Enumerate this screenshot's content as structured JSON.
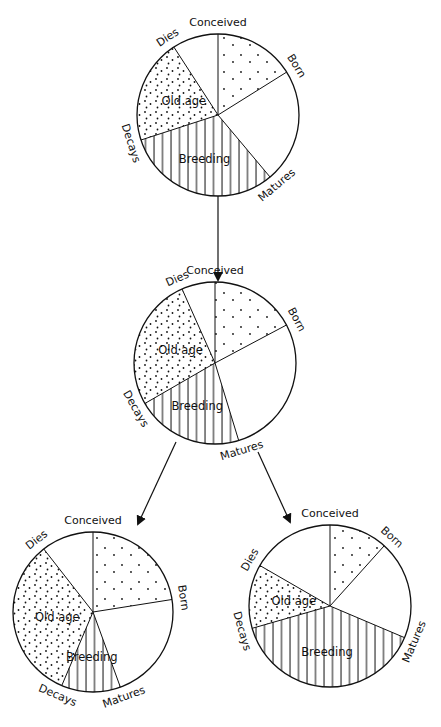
{
  "diagram": {
    "title": "",
    "stage_labels": {
      "conceived": "Conceived",
      "born": "Born",
      "matures": "Matures",
      "decays": "Decays",
      "dies": "Dies"
    },
    "phase_labels": {
      "old_age": "Old age",
      "breeding": "Breeding"
    },
    "patterns": {
      "juvenile": "dotted-sparse",
      "old_age": "dotted-dense",
      "breeding": "vertical-hatch",
      "maturation": "blank",
      "post_death": "blank"
    },
    "colors": {
      "ink": "#111111",
      "background": "#ffffff"
    },
    "pies": [
      {
        "id": "top",
        "cx": 218,
        "cy": 115,
        "r": 81,
        "angles": {
          "conceived": 0,
          "born": 58,
          "matures": 140,
          "decays": 252,
          "dies": 327
        }
      },
      {
        "id": "middle",
        "cx": 215,
        "cy": 363,
        "r": 81,
        "angles": {
          "conceived": 0,
          "born": 62,
          "matures": 163,
          "decays": 240,
          "dies": 336
        }
      },
      {
        "id": "bottom-left",
        "cx": 93,
        "cy": 612,
        "r": 80,
        "angles": {
          "conceived": 0,
          "born": 81,
          "matures": 160,
          "decays": 203,
          "dies": 322
        }
      },
      {
        "id": "bottom-right",
        "cx": 330,
        "cy": 606,
        "r": 81,
        "angles": {
          "conceived": 0,
          "born": 42,
          "matures": 113,
          "decays": 254,
          "dies": 300
        }
      }
    ],
    "arrows": [
      {
        "from": "top",
        "to": "middle",
        "x1": 218,
        "y1": 196,
        "x2": 218,
        "y2": 280
      },
      {
        "from": "middle",
        "to": "bottom-left",
        "x1": 176,
        "y1": 442,
        "x2": 138,
        "y2": 524
      },
      {
        "from": "middle",
        "to": "bottom-right",
        "x1": 258,
        "y1": 452,
        "x2": 290,
        "y2": 522
      }
    ]
  }
}
